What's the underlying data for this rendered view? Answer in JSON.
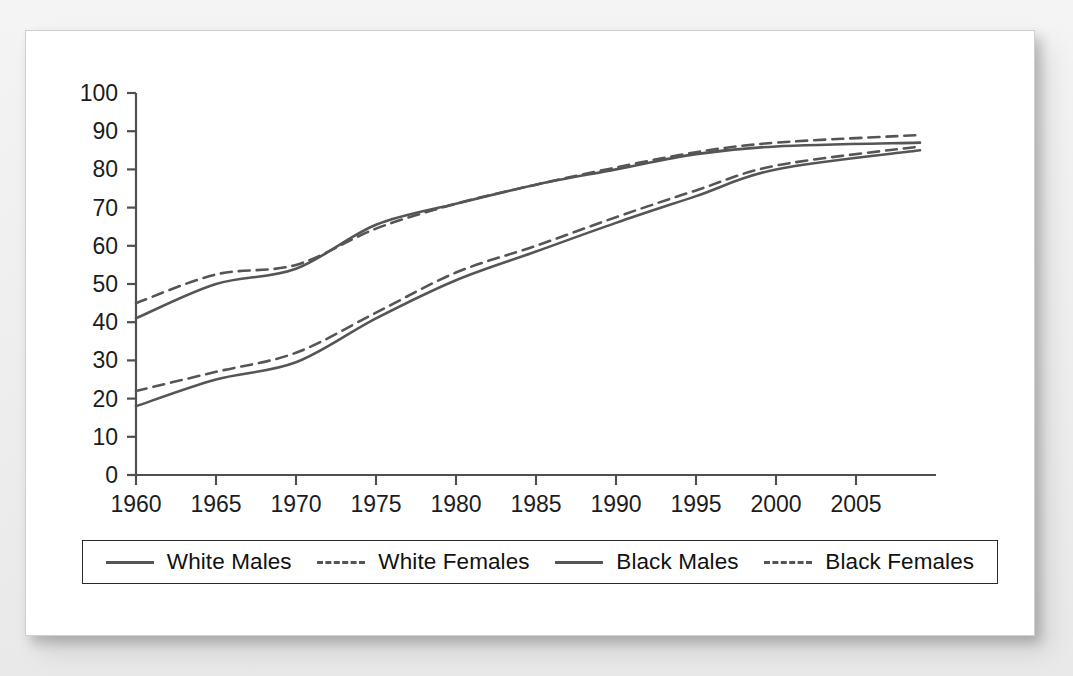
{
  "chart_data": {
    "type": "line",
    "title": "",
    "subtitle": "",
    "xlabel": "",
    "ylabel": "",
    "xlim": [
      1960,
      2009
    ],
    "ylim": [
      0,
      100
    ],
    "grid": false,
    "legend_position": "bottom",
    "x_ticks": [
      "1960",
      "1965",
      "1970",
      "1975",
      "1980",
      "1985",
      "1990",
      "1995",
      "2000",
      "2005"
    ],
    "y_ticks": [
      "0",
      "10",
      "20",
      "30",
      "40",
      "50",
      "60",
      "70",
      "80",
      "90",
      "100"
    ],
    "x": [
      1960,
      1965,
      1970,
      1975,
      1980,
      1985,
      1990,
      1995,
      2000,
      2009
    ],
    "series": [
      {
        "name": "White Males",
        "style": "solid",
        "color": "#555555",
        "values": [
          41,
          50,
          54,
          65.5,
          71,
          76,
          80,
          84,
          86,
          87
        ]
      },
      {
        "name": "White Females",
        "style": "dashed",
        "color": "#555555",
        "values": [
          45,
          52.5,
          55,
          64.5,
          71,
          76,
          80.5,
          84.5,
          87,
          89
        ]
      },
      {
        "name": "Black Males",
        "style": "solid",
        "color": "#555555",
        "values": [
          18,
          25,
          29.5,
          41,
          51,
          58.5,
          66,
          73,
          80,
          85
        ]
      },
      {
        "name": "Black Females",
        "style": "dashed",
        "color": "#555555",
        "values": [
          22,
          27,
          32,
          42.5,
          53,
          60,
          67.5,
          74.5,
          81,
          86
        ]
      }
    ]
  },
  "legend": {
    "entries": [
      {
        "label": "White Males",
        "style": "solid"
      },
      {
        "label": "White Females",
        "style": "dashed"
      },
      {
        "label": "Black Males",
        "style": "solid"
      },
      {
        "label": "Black Females",
        "style": "dashed"
      }
    ]
  },
  "colors": {
    "line": "#555555",
    "axis": "#4f4f4f",
    "card_background": "#ffffff",
    "page_background": "#f2f2f2",
    "text": "#1c1c1c"
  }
}
